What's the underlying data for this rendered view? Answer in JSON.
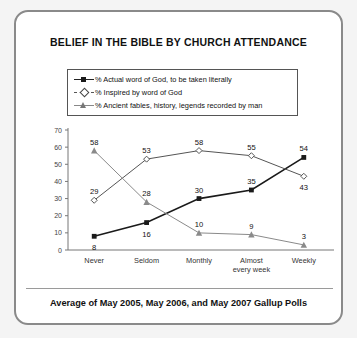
{
  "card": {
    "title": "BELIEF IN THE BIBLE BY CHURCH ATTENDANCE",
    "caption": "Average of May 2005, May 2006, and May 2007 Gallup Polls"
  },
  "legend": {
    "items": [
      {
        "label": "% Actual word of God, to be taken literally",
        "marker": "filled-square-icon"
      },
      {
        "label": "% Inspired by word of God",
        "marker": "open-diamond-icon"
      },
      {
        "label": "% Ancient fables, history, legends recorded by man",
        "marker": "triangle-icon"
      }
    ]
  },
  "chart_data": {
    "type": "line",
    "title": "BELIEF IN THE BIBLE BY CHURCH ATTENDANCE",
    "subtitle": "Average of May 2005, May 2006, and May 2007 Gallup Polls",
    "xlabel": "",
    "ylabel": "",
    "categories": [
      "Never",
      "Seldom",
      "Monthly",
      "Almost\never y week",
      "Weekly"
    ],
    "category_labels": [
      {
        "line1": "Never",
        "line2": ""
      },
      {
        "line1": "Seldom",
        "line2": ""
      },
      {
        "line1": "Monthly",
        "line2": ""
      },
      {
        "line1": "Almost",
        "line2": "every week"
      },
      {
        "line1": "Weekly",
        "line2": ""
      }
    ],
    "ylim": [
      0,
      70
    ],
    "yticks": [
      0,
      10,
      20,
      30,
      40,
      50,
      60,
      70
    ],
    "grid": false,
    "legend_position": "top",
    "series": [
      {
        "name": "% Actual word of God, to be taken literally",
        "marker": "filled-square",
        "color": "#1a1a1a",
        "values": [
          8,
          16,
          30,
          35,
          54
        ]
      },
      {
        "name": "% Inspired by word of God",
        "marker": "open-diamond",
        "color": "#555555",
        "values": [
          29,
          53,
          58,
          55,
          43
        ]
      },
      {
        "name": "% Ancient fables, history, legends recorded by man",
        "marker": "triangle",
        "color": "#8a8a8a",
        "values": [
          58,
          28,
          10,
          9,
          3
        ]
      }
    ]
  }
}
